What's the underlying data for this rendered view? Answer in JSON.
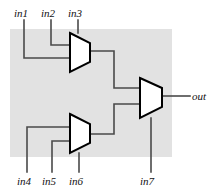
{
  "diagram": {
    "background_color": "#ffffff",
    "block_fill": "#e2e2e2",
    "mux_fill": "#ffffff",
    "mux_stroke": "#000000",
    "wire_color": "#4a4a4a",
    "label_color": "#111111",
    "labels": {
      "in1": "in1",
      "in2": "in2",
      "in3": "in3",
      "in4": "in4",
      "in5": "in5",
      "in6": "in6",
      "in7": "in7",
      "out": "out"
    },
    "components": [
      {
        "name": "mux-top",
        "inputs": [
          "in1",
          "in2"
        ],
        "select": "in3"
      },
      {
        "name": "mux-bottom",
        "inputs": [
          "in4",
          "in5"
        ],
        "select": "in6"
      },
      {
        "name": "mux-right",
        "inputs": [
          "mux-top",
          "mux-bottom"
        ],
        "select": "in7",
        "output": "out"
      }
    ]
  }
}
